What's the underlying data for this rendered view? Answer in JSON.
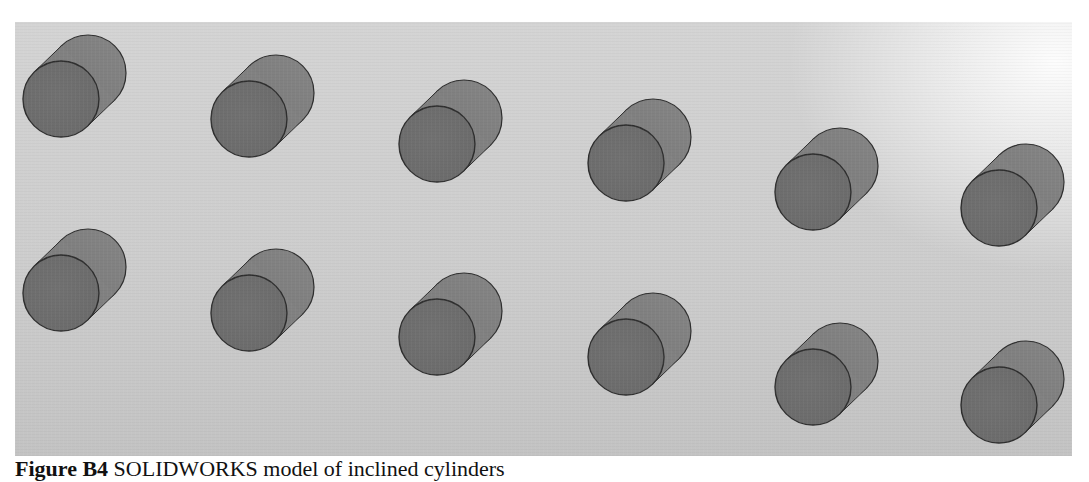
{
  "figure": {
    "label": "Figure B4",
    "caption_text": "SOLIDWORKS model of inclined cylinders",
    "colors": {
      "background": "#cdcdcd",
      "cylinder_face": "#6b6b6b",
      "cylinder_body": "#7a7a7a",
      "outline": "#2e2e2e"
    },
    "cylinder_radius": 38,
    "axis_offset": {
      "dx": 27,
      "dy": -26
    },
    "rows": [
      {
        "name": "upper-row",
        "cylinders": [
          {
            "cx": 46,
            "cy": 77
          },
          {
            "cx": 234,
            "cy": 97
          },
          {
            "cx": 422,
            "cy": 122
          },
          {
            "cx": 611,
            "cy": 141
          },
          {
            "cx": 798,
            "cy": 170
          },
          {
            "cx": 984,
            "cy": 186
          }
        ]
      },
      {
        "name": "lower-row",
        "cylinders": [
          {
            "cx": 46,
            "cy": 271
          },
          {
            "cx": 234,
            "cy": 291
          },
          {
            "cx": 422,
            "cy": 315
          },
          {
            "cx": 611,
            "cy": 335
          },
          {
            "cx": 798,
            "cy": 365
          },
          {
            "cx": 984,
            "cy": 383
          }
        ]
      }
    ]
  }
}
